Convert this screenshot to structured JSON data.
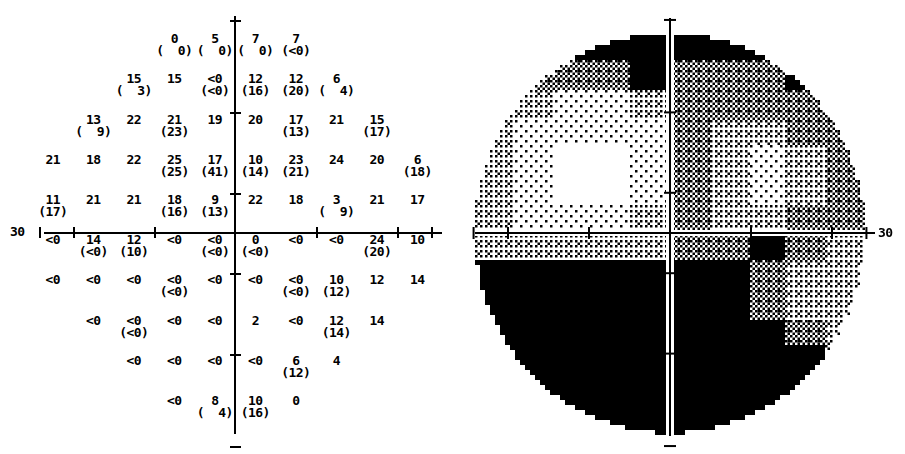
{
  "report": {
    "type": "visual-field-threshold-printout",
    "panels": [
      "numeric-sensitivity-plot",
      "grayscale-map"
    ]
  },
  "numeric_plot": {
    "axis_label_left": "30",
    "rows": [
      {
        "row": 1,
        "cells": [
          {
            "col": 4,
            "value": "0",
            "deviation": "(  0)"
          },
          {
            "col": 5,
            "value": "5",
            "deviation": "(  0)"
          },
          {
            "col": 6,
            "value": "7",
            "deviation": "(  0)"
          },
          {
            "col": 7,
            "value": "7",
            "deviation": "(<0)"
          }
        ]
      },
      {
        "row": 2,
        "cells": [
          {
            "col": 3,
            "value": "15",
            "deviation": "(  3)"
          },
          {
            "col": 4,
            "value": "15",
            "deviation": ""
          },
          {
            "col": 5,
            "value": "<0",
            "deviation": "(<0)"
          },
          {
            "col": 6,
            "value": "12",
            "deviation": "(16)"
          },
          {
            "col": 7,
            "value": "12",
            "deviation": "(20)"
          },
          {
            "col": 8,
            "value": "6",
            "deviation": "(  4)"
          }
        ]
      },
      {
        "row": 3,
        "cells": [
          {
            "col": 2,
            "value": "13",
            "deviation": "(  9)"
          },
          {
            "col": 3,
            "value": "22",
            "deviation": ""
          },
          {
            "col": 4,
            "value": "21",
            "deviation": "(23)"
          },
          {
            "col": 5,
            "value": "19",
            "deviation": ""
          },
          {
            "col": 6,
            "value": "20",
            "deviation": ""
          },
          {
            "col": 7,
            "value": "17",
            "deviation": "(13)"
          },
          {
            "col": 8,
            "value": "21",
            "deviation": ""
          },
          {
            "col": 9,
            "value": "15",
            "deviation": "(17)"
          }
        ]
      },
      {
        "row": 4,
        "cells": [
          {
            "col": 1,
            "value": "21",
            "deviation": ""
          },
          {
            "col": 2,
            "value": "18",
            "deviation": ""
          },
          {
            "col": 3,
            "value": "22",
            "deviation": ""
          },
          {
            "col": 4,
            "value": "25",
            "deviation": "(25)"
          },
          {
            "col": 5,
            "value": "17",
            "deviation": "(41)"
          },
          {
            "col": 6,
            "value": "10",
            "deviation": "(14)"
          },
          {
            "col": 7,
            "value": "23",
            "deviation": "(21)"
          },
          {
            "col": 8,
            "value": "24",
            "deviation": ""
          },
          {
            "col": 9,
            "value": "20",
            "deviation": ""
          },
          {
            "col": 10,
            "value": "6",
            "deviation": "(18)"
          }
        ]
      },
      {
        "row": 5,
        "cells": [
          {
            "col": 1,
            "value": "11",
            "deviation": "(17)"
          },
          {
            "col": 2,
            "value": "21",
            "deviation": ""
          },
          {
            "col": 3,
            "value": "21",
            "deviation": ""
          },
          {
            "col": 4,
            "value": "18",
            "deviation": "(16)"
          },
          {
            "col": 5,
            "value": "9",
            "deviation": "(13)"
          },
          {
            "col": 6,
            "value": "22",
            "deviation": ""
          },
          {
            "col": 7,
            "value": "18",
            "deviation": ""
          },
          {
            "col": 8,
            "value": "3",
            "deviation": "(  9)"
          },
          {
            "col": 9,
            "value": "21",
            "deviation": ""
          },
          {
            "col": 10,
            "value": "17",
            "deviation": ""
          }
        ]
      },
      {
        "row": 6,
        "cells": [
          {
            "col": 1,
            "value": "<0",
            "deviation": ""
          },
          {
            "col": 2,
            "value": "14",
            "deviation": "(<0)"
          },
          {
            "col": 3,
            "value": "12",
            "deviation": "(10)"
          },
          {
            "col": 4,
            "value": "<0",
            "deviation": ""
          },
          {
            "col": 5,
            "value": "<0",
            "deviation": "(<0)"
          },
          {
            "col": 6,
            "value": "0",
            "deviation": "(<0)"
          },
          {
            "col": 7,
            "value": "<0",
            "deviation": ""
          },
          {
            "col": 8,
            "value": "<0",
            "deviation": ""
          },
          {
            "col": 9,
            "value": "24",
            "deviation": "(20)"
          },
          {
            "col": 10,
            "value": "10",
            "deviation": ""
          }
        ]
      },
      {
        "row": 7,
        "cells": [
          {
            "col": 1,
            "value": "<0",
            "deviation": ""
          },
          {
            "col": 2,
            "value": "<0",
            "deviation": ""
          },
          {
            "col": 3,
            "value": "<0",
            "deviation": ""
          },
          {
            "col": 4,
            "value": "<0",
            "deviation": "(<0)"
          },
          {
            "col": 5,
            "value": "<0",
            "deviation": ""
          },
          {
            "col": 6,
            "value": "<0",
            "deviation": ""
          },
          {
            "col": 7,
            "value": "<0",
            "deviation": "(<0)"
          },
          {
            "col": 8,
            "value": "10",
            "deviation": "(12)"
          },
          {
            "col": 9,
            "value": "12",
            "deviation": ""
          },
          {
            "col": 10,
            "value": "14",
            "deviation": ""
          }
        ]
      },
      {
        "row": 8,
        "cells": [
          {
            "col": 2,
            "value": "<0",
            "deviation": ""
          },
          {
            "col": 3,
            "value": "<0",
            "deviation": "(<0)"
          },
          {
            "col": 4,
            "value": "<0",
            "deviation": ""
          },
          {
            "col": 5,
            "value": "<0",
            "deviation": ""
          },
          {
            "col": 6,
            "value": "2",
            "deviation": ""
          },
          {
            "col": 7,
            "value": "<0",
            "deviation": ""
          },
          {
            "col": 8,
            "value": "12",
            "deviation": "(14)"
          },
          {
            "col": 9,
            "value": "14",
            "deviation": ""
          }
        ]
      },
      {
        "row": 9,
        "cells": [
          {
            "col": 3,
            "value": "<0",
            "deviation": ""
          },
          {
            "col": 4,
            "value": "<0",
            "deviation": ""
          },
          {
            "col": 5,
            "value": "<0",
            "deviation": ""
          },
          {
            "col": 6,
            "value": "<0",
            "deviation": ""
          },
          {
            "col": 7,
            "value": "6",
            "deviation": "(12)"
          },
          {
            "col": 8,
            "value": "4",
            "deviation": ""
          }
        ]
      },
      {
        "row": 10,
        "cells": [
          {
            "col": 4,
            "value": "<0",
            "deviation": ""
          },
          {
            "col": 5,
            "value": "8",
            "deviation": "(  4)"
          },
          {
            "col": 6,
            "value": "10",
            "deviation": "(16)"
          },
          {
            "col": 7,
            "value": "0",
            "deviation": ""
          }
        ]
      }
    ]
  },
  "grayscale_map": {
    "axis_label_right": "30",
    "shades": [
      "white",
      "light-stipple",
      "mid-stipple",
      "dark-stipple",
      "black"
    ]
  },
  "chart_data": {
    "type": "heatmap",
    "title": "",
    "xlabel": "",
    "ylabel": "",
    "legend": [],
    "grid": false,
    "xlim": [
      -30,
      30
    ],
    "ylim": [
      -30,
      30
    ],
    "axis_tick_label": "30",
    "columns_deg": [
      -27,
      -21,
      -15,
      -9,
      -3,
      3,
      9,
      15,
      21,
      27
    ],
    "rows_deg": [
      27,
      21,
      15,
      9,
      3,
      -3,
      -9,
      -15,
      -21,
      -27
    ],
    "series": [
      {
        "name": "threshold-db",
        "values": [
          [
            null,
            null,
            null,
            0,
            5,
            7,
            7,
            null,
            null,
            null
          ],
          [
            null,
            null,
            15,
            15,
            "<0",
            12,
            12,
            6,
            null,
            null
          ],
          [
            null,
            13,
            22,
            21,
            19,
            20,
            17,
            21,
            15,
            null
          ],
          [
            21,
            18,
            22,
            25,
            17,
            10,
            23,
            24,
            20,
            6
          ],
          [
            11,
            21,
            21,
            18,
            9,
            22,
            18,
            3,
            21,
            17
          ],
          [
            "<0",
            14,
            12,
            "<0",
            "<0",
            0,
            "<0",
            "<0",
            24,
            10
          ],
          [
            "<0",
            "<0",
            "<0",
            "<0",
            "<0",
            "<0",
            "<0",
            10,
            12,
            14
          ],
          [
            null,
            "<0",
            "<0",
            "<0",
            "<0",
            2,
            "<0",
            12,
            14,
            null
          ],
          [
            null,
            null,
            "<0",
            "<0",
            "<0",
            "<0",
            6,
            4,
            null,
            null
          ],
          [
            null,
            null,
            null,
            "<0",
            8,
            10,
            0,
            null,
            null,
            null
          ]
        ]
      },
      {
        "name": "total-deviation-db",
        "values": [
          [
            null,
            null,
            null,
            0,
            0,
            0,
            "<0",
            null,
            null,
            null
          ],
          [
            null,
            null,
            3,
            null,
            "<0",
            16,
            20,
            4,
            null,
            null
          ],
          [
            null,
            9,
            null,
            23,
            null,
            null,
            13,
            null,
            17,
            null
          ],
          [
            null,
            null,
            null,
            25,
            41,
            14,
            21,
            null,
            null,
            18
          ],
          [
            17,
            null,
            null,
            16,
            13,
            null,
            null,
            9,
            null,
            null
          ],
          [
            null,
            "<0",
            10,
            null,
            "<0",
            "<0",
            null,
            null,
            20,
            null
          ],
          [
            null,
            null,
            null,
            "<0",
            null,
            null,
            "<0",
            12,
            null,
            null
          ],
          [
            null,
            null,
            "<0",
            null,
            null,
            null,
            null,
            14,
            null,
            null
          ],
          [
            null,
            null,
            null,
            null,
            null,
            null,
            12,
            null,
            null,
            null
          ],
          [
            null,
            null,
            null,
            null,
            4,
            16,
            null,
            null,
            null,
            null
          ]
        ]
      }
    ],
    "grayscale_levels": {
      "upper_left_quadrant": "mixed: dark superior rim, light central",
      "upper_right_quadrant": "mid-dark stipple throughout",
      "lower_left_quadrant": "dense black (absolute defect)",
      "lower_right_quadrant": "dense black with mid-stipple temporal edge"
    }
  }
}
